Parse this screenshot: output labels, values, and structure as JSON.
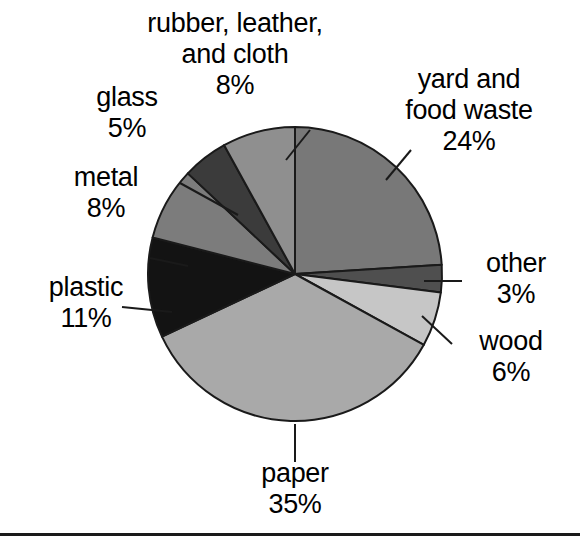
{
  "chart_data": {
    "type": "pie",
    "title": "",
    "subtitle": "",
    "xlabel": "",
    "ylabel": "",
    "legend_position": "none",
    "grid": false,
    "units": "percent",
    "start_angle_deg": 0,
    "direction": "clockwise",
    "center": {
      "x": 295,
      "y": 274
    },
    "radius": 147,
    "categories": [
      "yard and food waste",
      "other",
      "wood",
      "paper",
      "plastic",
      "metal",
      "glass",
      "rubber, leather, and cloth"
    ],
    "values": [
      24,
      3,
      6,
      35,
      11,
      8,
      5,
      8
    ],
    "slices": [
      {
        "name": "yard and food waste",
        "value": 24,
        "value_text": "24%",
        "label_lines": [
          "yard and",
          "food waste",
          "24%"
        ],
        "color": "#787878",
        "start_deg": 0,
        "end_deg": 86.4,
        "leader": true
      },
      {
        "name": "other",
        "value": 3,
        "value_text": "3%",
        "label_lines": [
          "other",
          "3%"
        ],
        "color": "#4f4f4f",
        "start_deg": 86.4,
        "end_deg": 97.2,
        "leader": true
      },
      {
        "name": "wood",
        "value": 6,
        "value_text": "6%",
        "label_lines": [
          "wood",
          "6%"
        ],
        "color": "#c6c6c6",
        "start_deg": 97.2,
        "end_deg": 118.8,
        "leader": true
      },
      {
        "name": "paper",
        "value": 35,
        "value_text": "35%",
        "label_lines": [
          "paper",
          "35%"
        ],
        "color": "#a9a9a9",
        "start_deg": 118.8,
        "end_deg": 244.8,
        "leader": true
      },
      {
        "name": "plastic",
        "value": 11,
        "value_text": "11%",
        "label_lines": [
          "plastic",
          "11%"
        ],
        "color": "#131313",
        "start_deg": 244.8,
        "end_deg": 284.4,
        "leader": true
      },
      {
        "name": "metal",
        "value": 8,
        "value_text": "8%",
        "label_lines": [
          "metal",
          "8%"
        ],
        "color": "#7c7c7c",
        "start_deg": 284.4,
        "end_deg": 313.2,
        "leader": true
      },
      {
        "name": "glass",
        "value": 5,
        "value_text": "5%",
        "label_lines": [
          "glass",
          "5%"
        ],
        "color": "#3b3b3b",
        "start_deg": 313.2,
        "end_deg": 331.2,
        "leader": true
      },
      {
        "name": "rubber, leather, and cloth",
        "value": 8,
        "value_text": "8%",
        "label_lines": [
          "rubber, leather,",
          "and cloth",
          "8%"
        ],
        "color": "#8f8f8f",
        "start_deg": 331.2,
        "end_deg": 360,
        "leader": true
      }
    ],
    "total": 100,
    "stroke_color": "#1a1a1a",
    "background": "#ffffff"
  },
  "labels": {
    "yard": {
      "l1": "yard and",
      "l2": "food waste",
      "l3": "24%"
    },
    "other": {
      "l1": "other",
      "l2": "3%"
    },
    "wood": {
      "l1": "wood",
      "l2": "6%"
    },
    "paper": {
      "l1": "paper",
      "l2": "35%"
    },
    "plastic": {
      "l1": "plastic",
      "l2": "11%"
    },
    "metal": {
      "l1": "metal",
      "l2": "8%"
    },
    "glass": {
      "l1": "glass",
      "l2": "5%"
    },
    "rubber": {
      "l1": "rubber, leather,",
      "l2": "and cloth",
      "l3": "8%"
    }
  }
}
